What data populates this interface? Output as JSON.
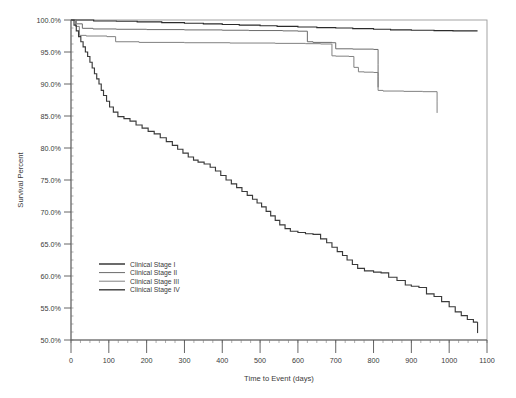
{
  "figure": {
    "background_color": "#ffffff",
    "top_rule_color": "#6f6f6f",
    "frame_color": "#9a9a9a"
  },
  "chart_data": {
    "type": "line",
    "title": "",
    "subtitle": "",
    "xlabel": "Time to Event (days)",
    "ylabel": "Survival Percent",
    "xlim": [
      0,
      1100
    ],
    "ylim": [
      50,
      100
    ],
    "grid": false,
    "legend_position": "inside-lower-left",
    "x_ticks": [
      0,
      100,
      200,
      300,
      400,
      500,
      600,
      700,
      800,
      900,
      1000,
      1100
    ],
    "x_tick_labels": [
      "0",
      "100",
      "200",
      "300",
      "400",
      "500",
      "600",
      "700",
      "800",
      "900",
      "1000",
      "1100"
    ],
    "x_minor_tick_interval": 25,
    "y_ticks": [
      50,
      55,
      60,
      65,
      70,
      75,
      80,
      85,
      90,
      95,
      100
    ],
    "y_tick_labels": [
      "50.0%",
      "55.0%",
      "60.0%",
      "65.0%",
      "70.0%",
      "75.0%",
      "80.0%",
      "85.0%",
      "90.0%",
      "95.0%",
      "100.0%"
    ],
    "y_minor_tick_interval": 1.25,
    "series": [
      {
        "name": "Clinical Stage I",
        "color": "#2b2b2b",
        "width": 1.15,
        "points": [
          [
            0,
            100.0
          ],
          [
            35,
            100.0
          ],
          [
            60,
            99.85
          ],
          [
            120,
            99.8
          ],
          [
            175,
            99.7
          ],
          [
            240,
            99.6
          ],
          [
            300,
            99.5
          ],
          [
            350,
            99.4
          ],
          [
            400,
            99.3
          ],
          [
            445,
            99.2
          ],
          [
            500,
            99.1
          ],
          [
            545,
            99.0
          ],
          [
            600,
            98.9
          ],
          [
            650,
            98.8
          ],
          [
            700,
            98.75
          ],
          [
            745,
            98.65
          ],
          [
            800,
            98.55
          ],
          [
            845,
            98.45
          ],
          [
            900,
            98.4
          ],
          [
            960,
            98.35
          ],
          [
            1010,
            98.3
          ],
          [
            1075,
            98.3
          ]
        ],
        "end_tick": false
      },
      {
        "name": "Clinical Stage II",
        "color": "#6b6b6b",
        "width": 1.0,
        "points": [
          [
            0,
            100.0
          ],
          [
            14,
            99.4
          ],
          [
            30,
            98.7
          ],
          [
            58,
            98.6
          ],
          [
            120,
            98.55
          ],
          [
            200,
            98.5
          ],
          [
            300,
            98.45
          ],
          [
            400,
            98.4
          ],
          [
            470,
            98.35
          ],
          [
            560,
            98.3
          ],
          [
            600,
            98.25
          ],
          [
            625,
            96.6
          ],
          [
            640,
            96.5
          ],
          [
            690,
            96.45
          ],
          [
            700,
            95.5
          ],
          [
            745,
            95.45
          ],
          [
            800,
            95.4
          ],
          [
            812,
            93.0
          ],
          [
            812,
            91.2
          ]
        ],
        "end_tick": true
      },
      {
        "name": "Clinical Stage III",
        "color": "#808080",
        "width": 1.0,
        "points": [
          [
            0,
            100.0
          ],
          [
            12,
            99.0
          ],
          [
            22,
            97.6
          ],
          [
            40,
            97.5
          ],
          [
            95,
            97.4
          ],
          [
            118,
            96.6
          ],
          [
            180,
            96.5
          ],
          [
            300,
            96.45
          ],
          [
            420,
            96.4
          ],
          [
            540,
            96.35
          ],
          [
            620,
            96.3
          ],
          [
            660,
            96.25
          ],
          [
            690,
            94.4
          ],
          [
            700,
            94.35
          ],
          [
            735,
            94.3
          ],
          [
            748,
            92.6
          ],
          [
            760,
            91.9
          ],
          [
            775,
            91.85
          ],
          [
            800,
            91.8
          ],
          [
            812,
            89.0
          ],
          [
            825,
            88.9
          ],
          [
            880,
            88.85
          ],
          [
            930,
            88.8
          ],
          [
            968,
            88.8
          ],
          [
            968,
            87.2
          ]
        ],
        "end_tick": true
      },
      {
        "name": "Clinical Stage IV",
        "color": "#3a3a3a",
        "width": 1.15,
        "points": [
          [
            0,
            100.0
          ],
          [
            8,
            99.2
          ],
          [
            14,
            98.3
          ],
          [
            20,
            97.4
          ],
          [
            26,
            96.6
          ],
          [
            32,
            95.8
          ],
          [
            38,
            95.0
          ],
          [
            44,
            94.3
          ],
          [
            50,
            93.4
          ],
          [
            56,
            92.5
          ],
          [
            62,
            91.6
          ],
          [
            68,
            90.8
          ],
          [
            74,
            90.0
          ],
          [
            80,
            89.0
          ],
          [
            86,
            88.2
          ],
          [
            94,
            87.3
          ],
          [
            102,
            86.4
          ],
          [
            112,
            85.6
          ],
          [
            124,
            84.9
          ],
          [
            140,
            84.6
          ],
          [
            156,
            84.2
          ],
          [
            172,
            83.6
          ],
          [
            188,
            83.1
          ],
          [
            204,
            82.6
          ],
          [
            220,
            82.2
          ],
          [
            236,
            81.6
          ],
          [
            252,
            81.0
          ],
          [
            268,
            80.4
          ],
          [
            282,
            79.8
          ],
          [
            296,
            79.2
          ],
          [
            310,
            78.6
          ],
          [
            324,
            78.1
          ],
          [
            336,
            77.8
          ],
          [
            352,
            77.5
          ],
          [
            368,
            77.0
          ],
          [
            382,
            76.4
          ],
          [
            396,
            75.7
          ],
          [
            410,
            75.0
          ],
          [
            424,
            74.4
          ],
          [
            438,
            73.8
          ],
          [
            452,
            73.2
          ],
          [
            466,
            72.6
          ],
          [
            480,
            72.0
          ],
          [
            492,
            71.4
          ],
          [
            504,
            70.8
          ],
          [
            516,
            70.1
          ],
          [
            528,
            69.4
          ],
          [
            540,
            68.7
          ],
          [
            552,
            68.0
          ],
          [
            566,
            67.4
          ],
          [
            580,
            67.0
          ],
          [
            600,
            66.8
          ],
          [
            620,
            66.6
          ],
          [
            640,
            66.5
          ],
          [
            660,
            65.8
          ],
          [
            676,
            65.2
          ],
          [
            690,
            64.5
          ],
          [
            704,
            63.8
          ],
          [
            718,
            63.2
          ],
          [
            730,
            62.5
          ],
          [
            744,
            61.8
          ],
          [
            758,
            61.2
          ],
          [
            776,
            60.8
          ],
          [
            800,
            60.6
          ],
          [
            820,
            60.5
          ],
          [
            840,
            59.8
          ],
          [
            862,
            59.3
          ],
          [
            884,
            58.6
          ],
          [
            900,
            58.4
          ],
          [
            920,
            58.2
          ],
          [
            940,
            57.2
          ],
          [
            960,
            56.8
          ],
          [
            980,
            56.0
          ],
          [
            1000,
            55.2
          ],
          [
            1016,
            54.4
          ],
          [
            1032,
            53.8
          ],
          [
            1048,
            53.2
          ],
          [
            1064,
            52.8
          ],
          [
            1075,
            52.8
          ]
        ],
        "end_tick": true
      }
    ],
    "legend": [
      {
        "label": "Clinical Stage I",
        "color": "#2b2b2b",
        "width": 1.4
      },
      {
        "label": "Clinical Stage II",
        "color": "#6b6b6b",
        "width": 1.0
      },
      {
        "label": "Clinical Stage III",
        "color": "#808080",
        "width": 1.0
      },
      {
        "label": "Clinical Stage IV",
        "color": "#3a3a3a",
        "width": 1.4
      }
    ]
  }
}
